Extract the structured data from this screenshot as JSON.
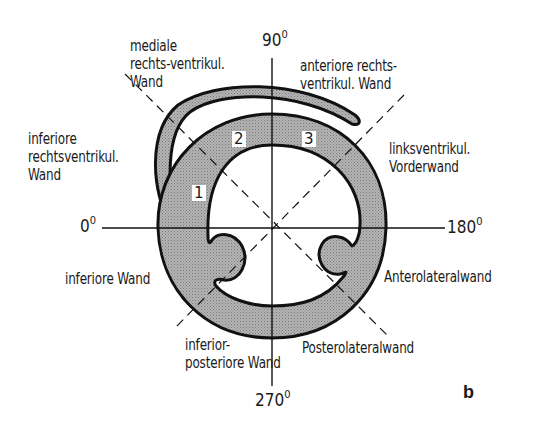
{
  "figure": {
    "panel_letter": "b",
    "colors": {
      "myocardium_fill": "#a9a9a9",
      "outline": "#111111",
      "background": "#ffffff"
    }
  },
  "axes": {
    "top": "90",
    "left": "0",
    "right": "180",
    "bottom": "270",
    "degree_symbol": "0"
  },
  "labels": {
    "medial_rv_wall": "mediale\nrechts-ventrikul.\nWand",
    "anterior_rv_wall": "anteriore rechts-\nventrikul. Wand",
    "inferior_rv_wall": "inferiore\nrechtsventrikul.\nWand",
    "lv_anterior_wall": "linksventrikul.\nVorderwand",
    "inferior_wall": "inferiore Wand",
    "anterolateral_wall": "Anterolateralwand",
    "inferoposterior_wall": "inferior-\nposteriore Wand",
    "posterolateral_wall": "Posterolateralwand"
  },
  "segments": [
    {
      "id": "1"
    },
    {
      "id": "2"
    },
    {
      "id": "3"
    }
  ]
}
